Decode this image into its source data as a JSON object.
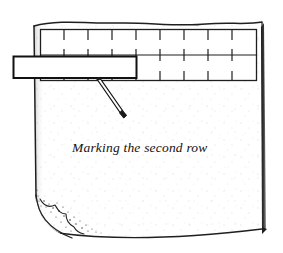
{
  "figure": {
    "title": "Marking the second row",
    "kind": "line-art-illustration",
    "canvas": {
      "width": 283,
      "height": 253,
      "background": "#ffffff"
    }
  },
  "caption": {
    "text": "Marking the second row",
    "style": "italic-serif",
    "x": 72,
    "y": 147,
    "color": "#15120f"
  },
  "colors": {
    "ink": "#1a1a1a",
    "line": "#2b2b2b",
    "shadow": "#111111",
    "paper": "#ffffff",
    "stipple": "#c9c9c9",
    "fabric_fill": "#fdfdfd"
  },
  "fabric": {
    "label": "fabric-piece",
    "top_edge": "wavy",
    "left_edge": "straight-shaded",
    "right_edge": "straight-heavy-shadow",
    "bottom_edge": "slightly-curved",
    "bounds": {
      "left": 33,
      "top": 21,
      "right": 264,
      "bottom": 237
    },
    "texture": "sparse-grey-speckle",
    "folded_corner": {
      "label": "folded-corner-bottom-left",
      "position": "bottom-left",
      "shading": "stippled"
    }
  },
  "ruler": {
    "label": "measuring-ruler",
    "description": "long horizontal ruler laid across the upper fabric",
    "bounds": {
      "left": 40,
      "top": 29,
      "right": 257,
      "bottom": 81
    },
    "rails": [
      "top-rail",
      "middle-rail",
      "bottom-rail"
    ],
    "tick_count_top": 9,
    "tick_count_middle": 9,
    "tick_count_bottom": 9,
    "tick_spacing_px": 24
  },
  "gauge": {
    "label": "marking-gauge",
    "description": "small rectangular gauge block overlapping the ruler at left",
    "bounds": {
      "left": 13,
      "top": 56,
      "right": 137,
      "bottom": 78
    }
  },
  "marking_tool": {
    "label": "marking-tool",
    "description": "thin pointed marker drawn diagonally down-right from the ruler",
    "start": {
      "x": 97,
      "y": 79
    },
    "end": {
      "x": 125,
      "y": 117
    },
    "tip": "pointed"
  }
}
